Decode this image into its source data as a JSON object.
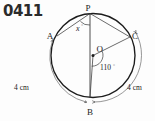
{
  "problem": {
    "number": "0411"
  },
  "figure": {
    "type": "circle-geometry",
    "stroke_color": "#1c1c1c",
    "background_color": "#fdfdfd",
    "circle": {
      "center_label": "O",
      "center_x": 93,
      "center_y": 55.5,
      "radius": 42
    },
    "points": [
      {
        "label": "P",
        "x": 90,
        "y": 13.5,
        "label_x": 88,
        "label_y": 11
      },
      {
        "label": "A",
        "x": 57,
        "y": 36,
        "label_x": 48,
        "label_y": 38
      },
      {
        "label": "C",
        "x": 130,
        "y": 37,
        "label_x": 133,
        "label_y": 37
      },
      {
        "label": "B",
        "x": 90,
        "y": 97.5,
        "label_x": 88,
        "label_y": 114
      },
      {
        "label": "O",
        "x": 93,
        "y": 55.5,
        "label_x": 95,
        "label_y": 50
      }
    ],
    "angles": [
      {
        "name": "angle-at-P",
        "label": "x",
        "unit": "°",
        "vertex": "P",
        "between": [
          "PA",
          "PB"
        ],
        "label_x": 79,
        "label_y": 30
      },
      {
        "name": "angle-at-O",
        "label": "110",
        "unit": "°",
        "vertex": "O",
        "between": [
          "OB",
          "OC"
        ],
        "value": 110,
        "label_x": 101,
        "label_y": 69
      }
    ],
    "arc_measures": [
      {
        "name": "arc-AB-length",
        "label": "4 cm",
        "side": "left",
        "label_x": 23,
        "label_y": 88
      },
      {
        "name": "arc-BC-length",
        "label": "4 cm",
        "side": "right",
        "label_x": 128,
        "label_y": 88
      }
    ],
    "segments": [
      {
        "name": "chord-PA",
        "from": "P",
        "to": "A"
      },
      {
        "name": "chord-PB",
        "from": "P",
        "to": "B"
      },
      {
        "name": "chord-PC",
        "from": "P",
        "to": "C"
      },
      {
        "name": "radius-OB",
        "from": "O",
        "to": "B"
      },
      {
        "name": "radius-OC",
        "from": "O",
        "to": "C"
      }
    ]
  }
}
